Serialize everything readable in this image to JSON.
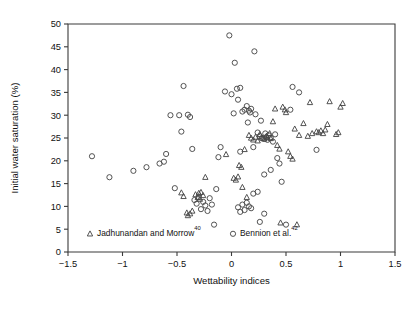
{
  "chart_data": {
    "type": "scatter",
    "title": "",
    "xlabel": "Wettability indices",
    "ylabel": "Initial water saturation (%)",
    "xlim": [
      -1.5,
      1.5
    ],
    "ylim": [
      0,
      50
    ],
    "xticks": [
      -1.5,
      -1,
      -0.5,
      0,
      0.5,
      1,
      1.5
    ],
    "xticklabels": [
      "−1.5",
      "−1",
      "−0.5",
      "0",
      "0.5",
      "1",
      "1.5"
    ],
    "yticks": [
      0,
      5,
      10,
      15,
      20,
      25,
      30,
      35,
      40,
      45,
      50
    ],
    "yticklabels": [
      "0",
      "5",
      "10",
      "15",
      "20",
      "25",
      "30",
      "35",
      "40",
      "45",
      "50"
    ],
    "grid": false,
    "legend_position": "inside-bottom",
    "series": [
      {
        "name": "Jadhunandan and Morrow",
        "name_superscript": "40",
        "marker": "triangle",
        "color": "#4a4a4a",
        "points": [
          [
            -0.46,
            13.0
          ],
          [
            -0.44,
            12.2
          ],
          [
            -0.41,
            8.6
          ],
          [
            -0.4,
            8.0
          ],
          [
            -0.38,
            8.4
          ],
          [
            -0.36,
            9.0
          ],
          [
            -0.33,
            12.6
          ],
          [
            -0.31,
            12.0
          ],
          [
            -0.3,
            12.9
          ],
          [
            -0.29,
            11.6
          ],
          [
            -0.28,
            13.1
          ],
          [
            -0.26,
            12.4
          ],
          [
            -0.24,
            16.4
          ],
          [
            -0.05,
            21.4
          ],
          [
            0.02,
            16.2
          ],
          [
            0.04,
            15.8
          ],
          [
            0.06,
            16.5
          ],
          [
            0.07,
            19.0
          ],
          [
            0.09,
            18.6
          ],
          [
            0.1,
            14.2
          ],
          [
            0.12,
            22.5
          ],
          [
            0.14,
            12.0
          ],
          [
            0.16,
            25.6
          ],
          [
            0.18,
            25.0
          ],
          [
            0.2,
            24.6
          ],
          [
            0.22,
            25.2
          ],
          [
            0.24,
            24.4
          ],
          [
            0.26,
            25.8
          ],
          [
            0.28,
            25.0
          ],
          [
            0.3,
            24.8
          ],
          [
            0.32,
            25.4
          ],
          [
            0.33,
            25.1
          ],
          [
            0.35,
            26.0
          ],
          [
            0.36,
            24.9
          ],
          [
            0.38,
            28.6
          ],
          [
            0.4,
            31.4
          ],
          [
            0.42,
            23.4
          ],
          [
            0.44,
            22.6
          ],
          [
            0.47,
            31.8
          ],
          [
            0.49,
            31.2
          ],
          [
            0.5,
            30.6
          ],
          [
            0.52,
            22.0
          ],
          [
            0.54,
            21.0
          ],
          [
            0.56,
            20.4
          ],
          [
            0.58,
            27.0
          ],
          [
            0.62,
            25.6
          ],
          [
            0.66,
            28.2
          ],
          [
            0.7,
            25.4
          ],
          [
            0.72,
            32.8
          ],
          [
            0.74,
            26.0
          ],
          [
            0.78,
            26.4
          ],
          [
            0.8,
            26.2
          ],
          [
            0.82,
            26.6
          ],
          [
            0.84,
            26.0
          ],
          [
            0.86,
            26.8
          ],
          [
            0.88,
            28.0
          ],
          [
            0.9,
            33.0
          ],
          [
            0.96,
            25.8
          ],
          [
            0.98,
            26.2
          ],
          [
            1.0,
            31.8
          ],
          [
            1.02,
            32.6
          ],
          [
            0.6,
            6.0
          ],
          [
            0.45,
            6.4
          ]
        ]
      },
      {
        "name": "Bennion et al.",
        "name_superscript": "42",
        "marker": "circle",
        "color": "#4a4a4a",
        "points": [
          [
            -1.28,
            21.0
          ],
          [
            -1.12,
            16.4
          ],
          [
            -0.9,
            17.8
          ],
          [
            -0.78,
            18.6
          ],
          [
            -0.66,
            19.4
          ],
          [
            -0.6,
            21.5
          ],
          [
            -0.62,
            19.8
          ],
          [
            -0.56,
            30.0
          ],
          [
            -0.48,
            30.0
          ],
          [
            -0.46,
            26.4
          ],
          [
            -0.4,
            30.1
          ],
          [
            -0.38,
            29.6
          ],
          [
            -0.36,
            22.6
          ],
          [
            -0.34,
            11.4
          ],
          [
            -0.32,
            10.6
          ],
          [
            -0.3,
            12.0
          ],
          [
            -0.28,
            9.4
          ],
          [
            -0.26,
            11.0
          ],
          [
            -0.24,
            10.2
          ],
          [
            -0.22,
            9.0
          ],
          [
            -0.2,
            11.8
          ],
          [
            -0.18,
            10.4
          ],
          [
            -0.16,
            6.0
          ],
          [
            -0.14,
            13.8
          ],
          [
            -0.1,
            23.0
          ],
          [
            -0.06,
            35.2
          ],
          [
            -0.02,
            47.5
          ],
          [
            0.0,
            34.6
          ],
          [
            0.02,
            30.4
          ],
          [
            0.03,
            41.5
          ],
          [
            0.05,
            35.8
          ],
          [
            0.06,
            33.4
          ],
          [
            0.08,
            36.0
          ],
          [
            0.1,
            30.8
          ],
          [
            0.12,
            31.2
          ],
          [
            0.14,
            32.0
          ],
          [
            0.15,
            28.4
          ],
          [
            0.16,
            31.0
          ],
          [
            0.17,
            30.6
          ],
          [
            0.18,
            31.4
          ],
          [
            0.2,
            23.0
          ],
          [
            0.21,
            44.0
          ],
          [
            0.22,
            30.2
          ],
          [
            0.24,
            26.2
          ],
          [
            0.26,
            25.4
          ],
          [
            0.27,
            28.8
          ],
          [
            0.28,
            25.0
          ],
          [
            0.3,
            24.8
          ],
          [
            0.31,
            26.0
          ],
          [
            0.32,
            25.2
          ],
          [
            0.33,
            24.6
          ],
          [
            0.34,
            25.6
          ],
          [
            0.36,
            25.0
          ],
          [
            0.38,
            24.2
          ],
          [
            0.4,
            25.8
          ],
          [
            0.42,
            20.6
          ],
          [
            0.44,
            19.4
          ],
          [
            0.36,
            18.0
          ],
          [
            0.3,
            17.0
          ],
          [
            0.24,
            13.2
          ],
          [
            0.2,
            12.8
          ],
          [
            0.18,
            9.6
          ],
          [
            0.16,
            10.0
          ],
          [
            0.14,
            10.8
          ],
          [
            0.12,
            9.2
          ],
          [
            0.1,
            10.4
          ],
          [
            0.08,
            8.8
          ],
          [
            0.06,
            9.8
          ],
          [
            0.26,
            6.6
          ],
          [
            0.5,
            6.0
          ],
          [
            0.3,
            8.4
          ],
          [
            0.46,
            15.4
          ],
          [
            0.56,
            36.2
          ],
          [
            0.62,
            35.0
          ],
          [
            0.78,
            22.4
          ],
          [
            -0.52,
            14.0
          ],
          [
            -0.44,
            36.4
          ],
          [
            0.54,
            31.2
          ],
          [
            0.08,
            22.0
          ],
          [
            -0.12,
            20.8
          ]
        ]
      }
    ]
  },
  "legend": {
    "items": [
      {
        "label": "Jadhunandan and Morrow",
        "superscript": "40",
        "marker": "triangle"
      },
      {
        "label": "Bennion et al.",
        "superscript": "42",
        "marker": "circle"
      }
    ]
  }
}
